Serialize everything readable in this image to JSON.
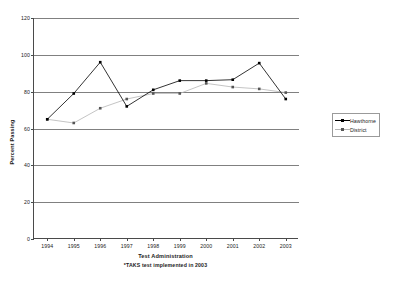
{
  "chart_data": {
    "type": "line",
    "title": "",
    "xlabel": "Test Administration",
    "xlabel_note": "*TAKS test implemented in 2003",
    "ylabel": "Percent Passing",
    "ylim": [
      0,
      120
    ],
    "yticks": [
      0,
      20,
      40,
      60,
      80,
      100,
      120
    ],
    "grid": "horizontal",
    "legend_position": "right",
    "categories": [
      "1994",
      "1995",
      "1996",
      "1997",
      "1998",
      "1999",
      "2000",
      "2001",
      "2002",
      "2003"
    ],
    "series": [
      {
        "name": "Hawthorne",
        "color": "#000000",
        "marker": "square",
        "values": [
          65,
          79,
          96,
          72,
          81,
          86,
          86,
          86.5,
          95.5,
          76
        ]
      },
      {
        "name": "District",
        "color": "#b5b5b5",
        "marker": "square",
        "values": [
          65,
          63,
          71,
          76,
          79,
          79,
          84.5,
          82.5,
          81.5,
          79.5
        ]
      }
    ]
  },
  "axis": {
    "color": "#4a4a4a",
    "gridline_color": "#808080"
  }
}
